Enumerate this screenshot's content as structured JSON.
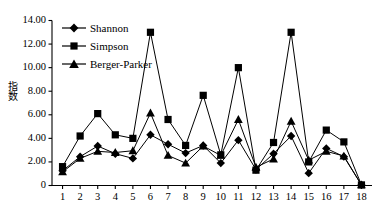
{
  "chart_data": {
    "type": "line",
    "title": "",
    "subtitle": "",
    "xlabel": "",
    "ylabel": "指数",
    "x": [
      1,
      2,
      3,
      4,
      5,
      6,
      7,
      8,
      9,
      10,
      11,
      12,
      13,
      14,
      15,
      16,
      17,
      18
    ],
    "categories": [
      "1",
      "2",
      "3",
      "4",
      "5",
      "6",
      "7",
      "8",
      "9",
      "10",
      "11",
      "12",
      "13",
      "14",
      "15",
      "16",
      "17",
      "18"
    ],
    "series": [
      {
        "name": "Shannon",
        "marker": "diamond",
        "values": [
          1.25,
          2.45,
          3.35,
          2.7,
          2.3,
          4.3,
          3.5,
          2.75,
          3.4,
          1.9,
          3.85,
          1.35,
          2.7,
          4.2,
          1.05,
          3.15,
          2.45,
          0.05
        ]
      },
      {
        "name": "Simpson",
        "marker": "square",
        "values": [
          1.6,
          4.2,
          6.1,
          4.3,
          4.0,
          13.0,
          5.6,
          3.4,
          7.65,
          2.6,
          10.0,
          1.3,
          3.65,
          13.0,
          2.0,
          4.7,
          3.7,
          0.05
        ]
      },
      {
        "name": "Berger-Parker",
        "marker": "triangle",
        "values": [
          1.15,
          2.3,
          2.9,
          2.8,
          2.95,
          6.15,
          2.55,
          1.9,
          3.35,
          2.55,
          5.6,
          1.55,
          2.25,
          5.45,
          2.15,
          2.9,
          2.5,
          0.05
        ]
      }
    ],
    "ylim": [
      0,
      14
    ],
    "yticks": [
      0,
      2,
      4,
      6,
      8,
      10,
      12,
      14
    ],
    "ytick_labels": [
      "0",
      "2.00",
      "4.00",
      "6.00",
      "8.00",
      "10.00",
      "12.00",
      "14.00"
    ],
    "xlim": [
      0.4,
      18.6
    ],
    "grid": false,
    "legend_position": "top-left",
    "line_color": "#000000",
    "marker_color": "#000000",
    "background_color": "#ffffff"
  },
  "legend": {
    "items": [
      {
        "label": "Shannon",
        "marker": "diamond"
      },
      {
        "label": "Simpson",
        "marker": "square"
      },
      {
        "label": "Berger-Parker",
        "marker": "triangle"
      }
    ]
  }
}
